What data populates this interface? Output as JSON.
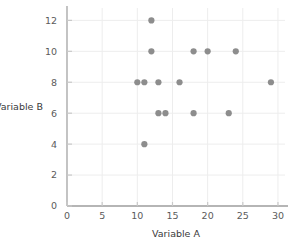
{
  "chart_data": {
    "type": "scatter",
    "title": "",
    "xlabel": "Variable A",
    "ylabel": "Variable B",
    "xlim": [
      0,
      31
    ],
    "ylim": [
      0,
      12.8
    ],
    "xticks": [
      0,
      5,
      10,
      15,
      20,
      25,
      30
    ],
    "xtick_labels": [
      "0",
      "5",
      "10",
      "15",
      "20",
      "25",
      "30"
    ],
    "yticks": [
      0,
      2,
      4,
      6,
      8,
      10,
      12
    ],
    "ytick_labels": [
      "0",
      "2",
      "4",
      "6",
      "8",
      "10",
      "12"
    ],
    "grid": true,
    "legend": false,
    "series": [
      {
        "name": "points",
        "marker": "circle",
        "color": "#8d8d8d",
        "marker_size": 3.1,
        "points": [
          {
            "x": 12,
            "y": 12
          },
          {
            "x": 12,
            "y": 10
          },
          {
            "x": 18,
            "y": 10
          },
          {
            "x": 20,
            "y": 10
          },
          {
            "x": 24,
            "y": 10
          },
          {
            "x": 10,
            "y": 8
          },
          {
            "x": 11,
            "y": 8
          },
          {
            "x": 13,
            "y": 8
          },
          {
            "x": 16,
            "y": 8
          },
          {
            "x": 29,
            "y": 8
          },
          {
            "x": 13,
            "y": 6
          },
          {
            "x": 14,
            "y": 6
          },
          {
            "x": 18,
            "y": 6
          },
          {
            "x": 23,
            "y": 6
          },
          {
            "x": 11,
            "y": 4
          }
        ]
      }
    ]
  },
  "colors": {
    "background": "#ffffff",
    "marker": "#8d8d8d",
    "axis_line": "#b5b5b5",
    "tick_mark": "#c9c9c9",
    "grid_line": "#ededed",
    "tick_text": "#5b5b5b",
    "axis_title_text": "#3a3a3a"
  },
  "geometry": {
    "plot_left": 67,
    "plot_right": 285,
    "plot_top": 8,
    "plot_bottom": 206
  }
}
